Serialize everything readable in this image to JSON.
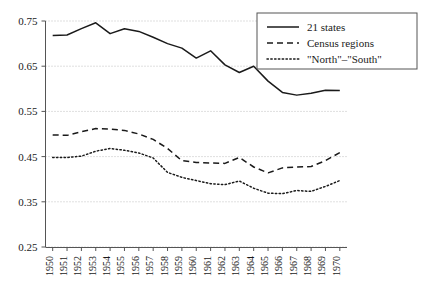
{
  "chart_data": {
    "type": "line",
    "title": "",
    "xlabel": "",
    "ylabel": "",
    "grid": true,
    "legend_position": "top-right",
    "xlim": [
      1950,
      1970
    ],
    "ylim": [
      0.25,
      0.75
    ],
    "ytick_labels": [
      "0.75",
      "0.65",
      "0.55",
      "0.45",
      "0.35",
      "0.25"
    ],
    "ytick_values": [
      0.75,
      0.65,
      0.55,
      0.45,
      0.35,
      0.25
    ],
    "categories": [
      "1950",
      "1951",
      "1952",
      "1953",
      "1954",
      "1955",
      "1956",
      "1957",
      "1958",
      "1959",
      "1960",
      "1961",
      "1962",
      "1963",
      "1964",
      "1965",
      "1966",
      "1967",
      "1968",
      "1969",
      "1970"
    ],
    "series": [
      {
        "name": "21 states",
        "style": "solid",
        "values": [
          0.718,
          0.719,
          0.733,
          0.746,
          0.722,
          0.733,
          0.727,
          0.714,
          0.7,
          0.69,
          0.668,
          0.684,
          0.653,
          0.636,
          0.65,
          0.617,
          0.592,
          0.586,
          0.59,
          0.597,
          0.596
        ]
      },
      {
        "name": "Census regions",
        "style": "dashed",
        "values": [
          0.498,
          0.497,
          0.505,
          0.512,
          0.511,
          0.508,
          0.5,
          0.488,
          0.468,
          0.441,
          0.437,
          0.436,
          0.435,
          0.448,
          0.427,
          0.414,
          0.425,
          0.427,
          0.428,
          0.441,
          0.459
        ]
      },
      {
        "name": "\"North\"–\"South\"",
        "style": "dotted",
        "values": [
          0.448,
          0.448,
          0.451,
          0.462,
          0.468,
          0.464,
          0.458,
          0.447,
          0.415,
          0.404,
          0.397,
          0.39,
          0.388,
          0.396,
          0.38,
          0.369,
          0.368,
          0.375,
          0.373,
          0.384,
          0.397
        ]
      }
    ]
  },
  "legend": {
    "entries": [
      {
        "label": "21 states"
      },
      {
        "label": "Census regions"
      },
      {
        "label": "\"North\"–\"South\""
      }
    ]
  },
  "colors": {
    "line": "#1a1a1a",
    "grid": "#bfbfbf",
    "axis": "#555555",
    "background": "#ffffff"
  }
}
